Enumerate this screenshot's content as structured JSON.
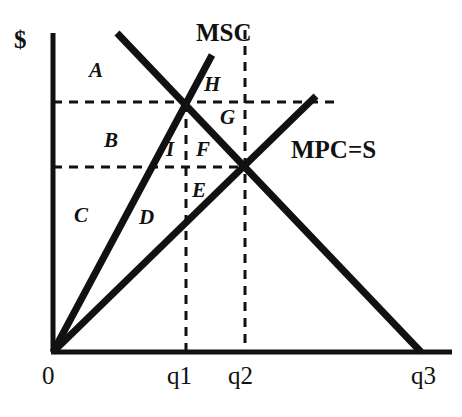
{
  "figure": {
    "type": "economics-externality-diagram",
    "axis_y_label": "$",
    "axis_x_origin_label": "0",
    "background_color": "#ffffff",
    "line_color": "#111111"
  },
  "curves": [
    {
      "id": "msc",
      "label": "MSC",
      "description": "Marginal Social Cost, steeper upward sloping line from origin",
      "x1": 53,
      "y1": 352,
      "x2": 212,
      "y2": 55
    },
    {
      "id": "mpc",
      "label": "MPC=S",
      "description": "Marginal Private Cost equals Supply, flatter upward sloping line from origin",
      "x1": 53,
      "y1": 352,
      "x2": 316,
      "y2": 96
    },
    {
      "id": "demand",
      "label": "",
      "description": "Downward sloping demand curve",
      "x1": 117,
      "y1": 33,
      "x2": 421,
      "y2": 352
    }
  ],
  "guides": {
    "vertical": [
      {
        "id": "q1-line",
        "x": 186,
        "y_top": 103,
        "y_bottom": 352
      },
      {
        "id": "q2-line",
        "x": 245,
        "y_top": 30,
        "y_bottom": 352
      }
    ],
    "horizontal": [
      {
        "id": "price-high-line",
        "y": 102,
        "x_left": 53,
        "x_right": 336
      },
      {
        "id": "price-low-line",
        "y": 167,
        "x_left": 53,
        "x_right": 247
      }
    ]
  },
  "intersections": [
    {
      "id": "msc-demand",
      "x": 186,
      "y": 102,
      "note": "socially optimal point at q1"
    },
    {
      "id": "mpc-demand",
      "x": 245,
      "y": 167,
      "note": "market equilibrium at q2"
    }
  ],
  "axes": {
    "y_axis": {
      "x": 53,
      "y_top": 33,
      "y_bottom": 352
    },
    "x_axis": {
      "y": 352,
      "x_left": 53,
      "x_right": 452
    }
  },
  "labels": {
    "y_axis_dollar": {
      "text": "$",
      "x": 14,
      "y": 27
    },
    "curve_msc": {
      "text": "MSC",
      "x": 196,
      "y": 20
    },
    "curve_mpc_s": {
      "text": "MPC=S",
      "x": 291,
      "y": 137
    },
    "origin": {
      "text": "0",
      "x": 42,
      "y": 363
    },
    "tick_q1": {
      "text": "q1",
      "x": 167,
      "y": 363
    },
    "tick_q2": {
      "text": "q2",
      "x": 228,
      "y": 363
    },
    "tick_q3": {
      "text": "q3",
      "x": 411,
      "y": 363
    }
  },
  "regions": [
    {
      "letter": "A",
      "x": 89,
      "y": 60,
      "description": "area above high price, left of demand"
    },
    {
      "letter": "B",
      "x": 104,
      "y": 130,
      "description": "area between the two price lines"
    },
    {
      "letter": "C",
      "x": 74,
      "y": 205,
      "description": "area below low price, left of MSC"
    },
    {
      "letter": "D",
      "x": 139,
      "y": 207,
      "description": "area between MSC and MPC below low price"
    },
    {
      "letter": "E",
      "x": 192,
      "y": 180,
      "description": "small triangle below low price right of q1"
    },
    {
      "letter": "F",
      "x": 196,
      "y": 139,
      "description": "area between q1 line and demand above low price"
    },
    {
      "letter": "G",
      "x": 220,
      "y": 107,
      "description": "area under high price line right of intersection"
    },
    {
      "letter": "H",
      "x": 204,
      "y": 74,
      "description": "small triangle above high price line"
    },
    {
      "letter": "I",
      "x": 166,
      "y": 139,
      "description": "narrow sliver left of q1 line above low price"
    }
  ]
}
